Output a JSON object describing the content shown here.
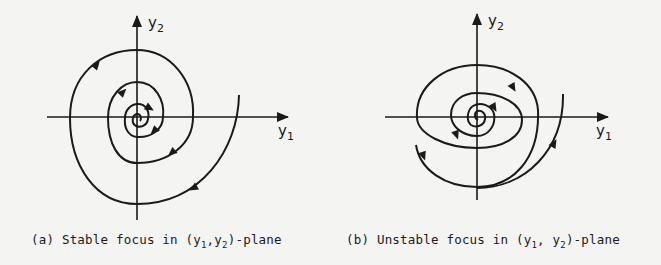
{
  "figure": {
    "colors": {
      "ink": "#1a1a1a",
      "paper": "#f4f4f2"
    },
    "panels": [
      {
        "id": "a",
        "type": "stable-focus",
        "x_axis_label": {
          "base": "y",
          "sub": "1"
        },
        "y_axis_label": {
          "base": "y",
          "sub": "2"
        },
        "caption": {
          "prefix": "(a) Stable focus in (",
          "v1": "y",
          "s1": "1",
          "sep": ",",
          "v2": "y",
          "s2": "2",
          "suffix": ")-plane"
        },
        "trajectory_direction": "inward"
      },
      {
        "id": "b",
        "type": "unstable-focus",
        "x_axis_label": {
          "base": "y",
          "sub": "1"
        },
        "y_axis_label": {
          "base": "y",
          "sub": "2"
        },
        "caption": {
          "prefix": "(b) Unstable focus in (",
          "v1": "y",
          "s1": "1",
          "sep": ", ",
          "v2": "y",
          "s2": "2",
          "suffix": ")-plane"
        },
        "trajectory_direction": "outward"
      }
    ]
  }
}
